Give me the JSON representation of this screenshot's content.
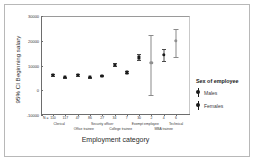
{
  "chart_data": {
    "type": "scatter",
    "title": "",
    "xlabel": "Employment category",
    "ylabel": "95% CI Beginning salary",
    "ylim": [
      -10000,
      30000
    ],
    "yticks": [
      30000,
      20000,
      10000,
      0,
      -10000
    ],
    "ytick_labels": [
      "30000",
      "20000",
      "10000",
      "0",
      "-10000"
    ],
    "grid": false,
    "legend_position": "right",
    "n_prefix": "N =",
    "categories": [
      "Clerical",
      "Office trainee",
      "Security officer",
      "College trainee",
      "Exempt employee",
      "MBA trainee",
      "Technical"
    ],
    "legend": {
      "title": "Sex of employee",
      "entries": [
        {
          "name": "Males",
          "color": "#1a1a1a"
        },
        {
          "name": "Females",
          "color": "#1a1a1a"
        }
      ]
    },
    "points": [
      {
        "category": "Clerical",
        "series": "Males",
        "n": "110",
        "mean": 6200,
        "ci_low": 5850,
        "ci_high": 6550
      },
      {
        "category": "Clerical",
        "series": "Females",
        "n": "117",
        "mean": 5250,
        "ci_low": 5050,
        "ci_high": 5450
      },
      {
        "category": "Office trainee",
        "series": "Males",
        "n": "47",
        "mean": 6100,
        "ci_low": 5800,
        "ci_high": 6400
      },
      {
        "category": "Office trainee",
        "series": "Females",
        "n": "86",
        "mean": 5250,
        "ci_low": 5100,
        "ci_high": 5400
      },
      {
        "category": "Security officer",
        "series": "Males",
        "n": "27",
        "mean": 5900,
        "ci_low": 5650,
        "ci_high": 6150
      },
      {
        "category": "College trainee",
        "series": "Males",
        "n": "34",
        "mean": 10400,
        "ci_low": 9700,
        "ci_high": 11100
      },
      {
        "category": "College trainee",
        "series": "Females",
        "n": "7",
        "mean": 7200,
        "ci_low": 6800,
        "ci_high": 7600
      },
      {
        "category": "Exempt employee",
        "series": "Males",
        "n": "30",
        "mean": 13300,
        "ci_low": 12200,
        "ci_high": 14600
      },
      {
        "category": "Exempt employee",
        "series": "Females",
        "n": "2",
        "mean": 11000,
        "ci_low": -2000,
        "ci_high": 22500
      },
      {
        "category": "MBA trainee",
        "series": "Males",
        "n": "4",
        "mean": 14200,
        "ci_low": 11800,
        "ci_high": 16600
      },
      {
        "category": "Technical",
        "series": "Males",
        "n": "6",
        "mean": 20100,
        "ci_low": 13500,
        "ci_high": 24700
      }
    ]
  }
}
